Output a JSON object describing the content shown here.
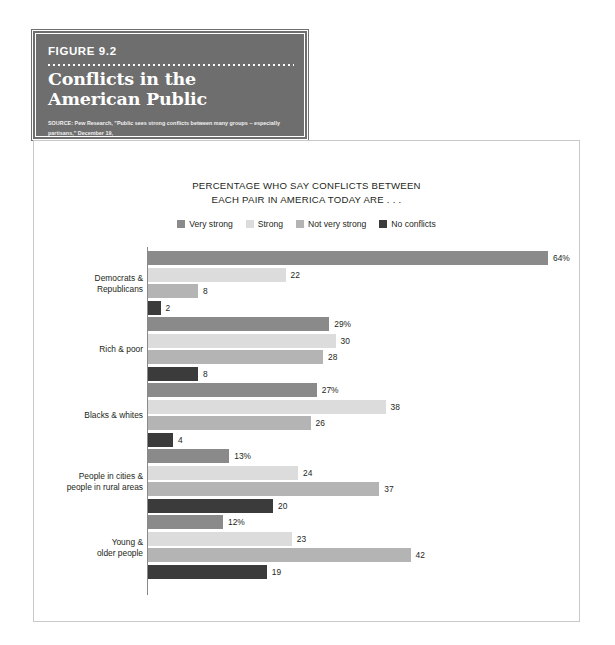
{
  "figure": {
    "number": "FIGURE 9.2",
    "title": "Conflicts in the American Public",
    "source_lines": [
      "SOURCE: Pew Research, \"Public sees strong conflicts between many groups – especially partisans,\" December 19,",
      "2017. www.pewresearch.org/fact-tank/2017/12/19/far-more-americans-say-there-are-strong-conflicts-between-",
      "partisans-than-between-other-groups-in-society/ft_17-12-19_politics_publicsees/ (accessed 5/15/18)."
    ]
  },
  "colors": {
    "very_strong": "#8a8a8a",
    "strong": "#dcdcdc",
    "not_very_strong": "#b4b4b4",
    "no_conflicts": "#3b3b3b",
    "header_bg": "#6e6e6e",
    "panel_border": "#c9c9c9",
    "axis": "#8a8a8a",
    "text": "#231f20"
  },
  "chart_data": {
    "type": "bar",
    "orientation": "horizontal",
    "title": "PERCENTAGE WHO SAY CONFLICTS BETWEEN EACH PAIR IN AMERICA TODAY ARE . . .",
    "title_lines": [
      "PERCENTAGE WHO SAY CONFLICTS BETWEEN",
      "EACH PAIR IN AMERICA TODAY ARE . . ."
    ],
    "xlabel": "",
    "ylabel": "",
    "xlim": [
      0,
      64
    ],
    "grid": false,
    "legend_position": "top-center",
    "categories": [
      "Democrats & Republicans",
      "Rich & poor",
      "Blacks & whites",
      "People in cities & people in rural areas",
      "Young & older people"
    ],
    "category_lines": [
      [
        "Democrats &",
        "Republicans"
      ],
      [
        "Rich & poor"
      ],
      [
        "Blacks & whites"
      ],
      [
        "People in cities &",
        "people in rural areas"
      ],
      [
        "Young &",
        "older people"
      ]
    ],
    "series": [
      {
        "name": "Very strong",
        "color": "#8a8a8a",
        "values": [
          64,
          29,
          27,
          13,
          12
        ],
        "labels": [
          "64%",
          "29%",
          "27%",
          "13%",
          "12%"
        ]
      },
      {
        "name": "Strong",
        "color": "#dcdcdc",
        "values": [
          22,
          30,
          38,
          24,
          23
        ],
        "labels": [
          "22",
          "30",
          "38",
          "24",
          "23"
        ]
      },
      {
        "name": "Not very strong",
        "color": "#b4b4b4",
        "values": [
          8,
          28,
          26,
          37,
          42
        ],
        "labels": [
          "8",
          "28",
          "26",
          "37",
          "42"
        ]
      },
      {
        "name": "No conflicts",
        "color": "#3b3b3b",
        "values": [
          2,
          8,
          4,
          20,
          19
        ],
        "labels": [
          "2",
          "8",
          "4",
          "20",
          "19"
        ]
      }
    ]
  }
}
